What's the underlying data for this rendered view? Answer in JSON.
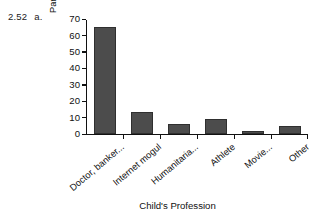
{
  "figure": {
    "number": "2.52",
    "part": "a."
  },
  "chart_data": {
    "type": "bar",
    "title": "",
    "xlabel": "Child's Profession",
    "ylabel": "Parent's Preference (%)",
    "categories": [
      "Doctor, banker...",
      "Internet mogul",
      "Humanitaria...",
      "Athlete",
      "Movie...",
      "Other"
    ],
    "values": [
      65,
      13,
      6,
      9,
      1.5,
      4.5
    ],
    "ylim": [
      0,
      70
    ],
    "yticks": [
      0,
      10,
      20,
      30,
      40,
      50,
      60,
      70
    ],
    "ytick_labels": [
      "0",
      "10",
      "20",
      "30",
      "40",
      "50",
      "60",
      "70"
    ],
    "grid": false,
    "legend": false,
    "bar_color": "#4c4c4c",
    "bar_edge_color": "#2f2f2f",
    "axis_color": "#111111",
    "background": "#ffffff"
  }
}
